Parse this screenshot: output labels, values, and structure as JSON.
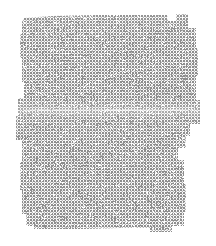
{
  "image": {
    "kind": "texture-swatch",
    "description": "Scanned halftone / cross-hatch dither texture patch with ragged stepped edges on a white background",
    "width": 216,
    "height": 246,
    "background_color": "#ffffff",
    "alt_text": "Light gray finely dithered rectangular texture patch with irregular stepped edges on white"
  },
  "swatch": {
    "label": "texture-swatch",
    "fill_dark_color": "#8d8d8d",
    "fill_mid_color": "#b6b6b6",
    "fill_light_color": "#ffffff",
    "pattern_period_px": 3,
    "pattern_type": "halftone-cross-hatch",
    "bounds": {
      "left": 16,
      "top": 14,
      "right": 200,
      "bottom": 233
    },
    "outline_points": [
      [
        24,
        18
      ],
      [
        52,
        16
      ],
      [
        96,
        15
      ],
      [
        140,
        15
      ],
      [
        168,
        15
      ],
      [
        168,
        21
      ],
      [
        176,
        21
      ],
      [
        176,
        14
      ],
      [
        188,
        14
      ],
      [
        188,
        28
      ],
      [
        196,
        28
      ],
      [
        196,
        48
      ],
      [
        198,
        48
      ],
      [
        198,
        76
      ],
      [
        196,
        76
      ],
      [
        196,
        100
      ],
      [
        200,
        100
      ],
      [
        200,
        124
      ],
      [
        190,
        124
      ],
      [
        190,
        136
      ],
      [
        186,
        136
      ],
      [
        186,
        148
      ],
      [
        178,
        148
      ],
      [
        178,
        160
      ],
      [
        184,
        160
      ],
      [
        184,
        184
      ],
      [
        186,
        184
      ],
      [
        186,
        212
      ],
      [
        184,
        212
      ],
      [
        184,
        226
      ],
      [
        172,
        226
      ],
      [
        172,
        232
      ],
      [
        150,
        232
      ],
      [
        150,
        228
      ],
      [
        120,
        228
      ],
      [
        84,
        229
      ],
      [
        52,
        229
      ],
      [
        34,
        229
      ],
      [
        34,
        226
      ],
      [
        26,
        226
      ],
      [
        26,
        214
      ],
      [
        22,
        214
      ],
      [
        22,
        190
      ],
      [
        20,
        190
      ],
      [
        20,
        162
      ],
      [
        22,
        162
      ],
      [
        22,
        140
      ],
      [
        16,
        140
      ],
      [
        16,
        116
      ],
      [
        18,
        116
      ],
      [
        18,
        98
      ],
      [
        24,
        98
      ],
      [
        24,
        82
      ],
      [
        22,
        82
      ],
      [
        22,
        58
      ],
      [
        20,
        58
      ],
      [
        20,
        34
      ],
      [
        22,
        34
      ],
      [
        22,
        22
      ]
    ],
    "seam": {
      "label": "horizontal-seam",
      "y": 109,
      "x_start": 18,
      "x_end": 200,
      "color": "#ffffff"
    }
  }
}
